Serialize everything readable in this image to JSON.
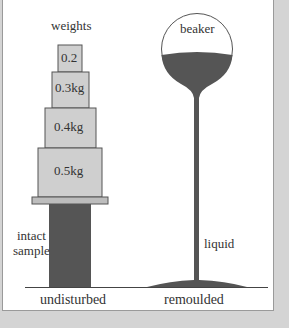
{
  "diagram": {
    "left": {
      "title": "weights",
      "weights": [
        {
          "label": "0.2"
        },
        {
          "label": "0.3kg"
        },
        {
          "label": "0.4kg"
        },
        {
          "label": "0.5kg"
        }
      ],
      "sample_label_line1": "intact",
      "sample_label_line2": "sample",
      "caption": "undisturbed"
    },
    "right": {
      "container_label": "beaker",
      "stream_label": "liquid",
      "caption": "remoulded"
    },
    "colors": {
      "weight_fill": "#cfcfcf",
      "outline": "#555555",
      "dark_fill": "#555555",
      "background": "#ffffff",
      "frame": "#d4d4d4"
    }
  }
}
